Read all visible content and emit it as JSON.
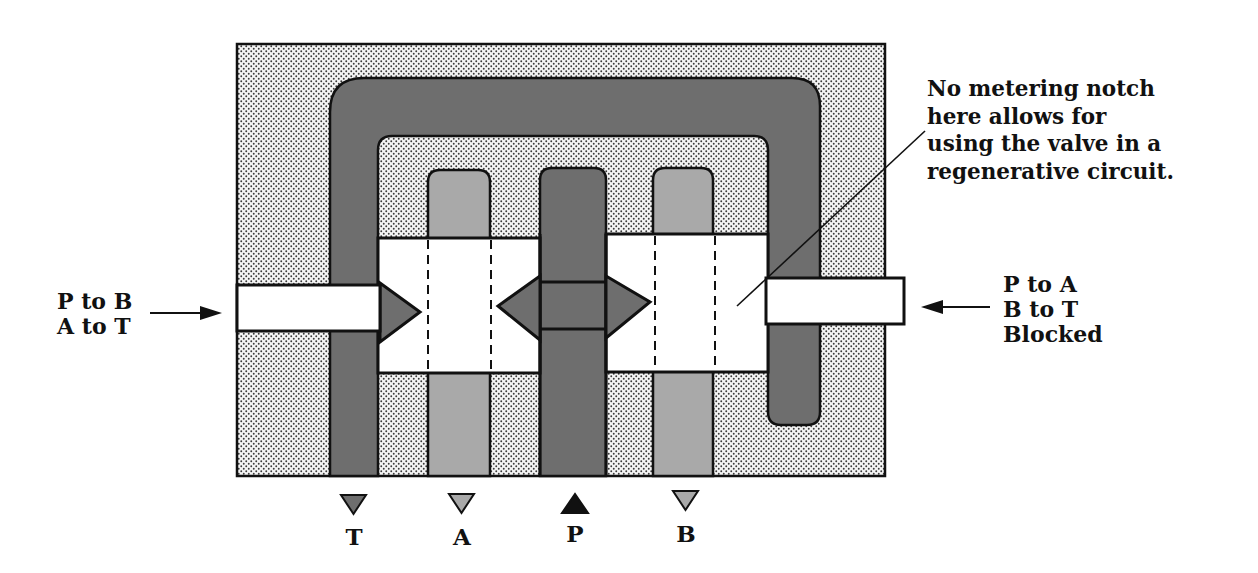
{
  "figure": {
    "type": "hydraulic directional control valve cross-section",
    "colors": {
      "body_stipple_bg": "#f2f2f2",
      "stipple_dot": "#3a3a3a",
      "tank_pressure_passage": "#6e6e6e",
      "work_port_passage": "#a9a9a9",
      "spool_bore": "#ffffff",
      "outline": "#111111"
    }
  },
  "annotation": {
    "lines": [
      "No metering notch",
      "here allows for",
      "using the valve in a",
      "regenerative circuit."
    ]
  },
  "left_actuation": {
    "lines": [
      "P to B",
      "A to T"
    ],
    "arrow": "right-arrow"
  },
  "right_actuation": {
    "lines": [
      "P to A",
      "B to T",
      "Blocked"
    ],
    "arrow": "left-arrow"
  },
  "ports": [
    {
      "label": "T",
      "symbol": "down-triangle",
      "color": "#6e6e6e"
    },
    {
      "label": "A",
      "symbol": "down-triangle",
      "color": "#a9a9a9"
    },
    {
      "label": "P",
      "symbol": "up-triangle",
      "color": "#111111"
    },
    {
      "label": "B",
      "symbol": "down-triangle",
      "color": "#a9a9a9"
    }
  ]
}
